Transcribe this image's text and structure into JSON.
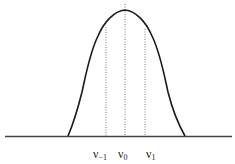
{
  "diagram": {
    "type": "bell-curve",
    "colors": {
      "curve": "#1a1a1a",
      "axis": "#444444",
      "markers": "#555555",
      "background": "#ffffff"
    },
    "markers": [
      {
        "id": "nu-minus-1",
        "symbol": "ν",
        "subscript": "−1",
        "x": 106
      },
      {
        "id": "nu-0",
        "symbol": "ν",
        "subscript": "0",
        "x": 125
      },
      {
        "id": "nu-1",
        "symbol": "ν",
        "subscript": "1",
        "x": 145
      }
    ]
  },
  "labels": {
    "m1_sym": "ν",
    "m1_sub": "−1",
    "m0_sym": "ν",
    "m0_sub": "0",
    "p1_sym": "ν",
    "p1_sub": "1"
  }
}
